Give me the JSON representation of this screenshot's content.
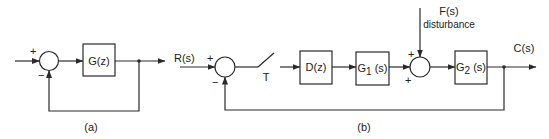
{
  "diagram_a": {
    "block": "G(z)",
    "sum_plus": "+",
    "sum_minus": "−",
    "caption": "(a)"
  },
  "diagram_b": {
    "input_label": "R(s)",
    "sum1_plus": "+",
    "sum1_minus": "−",
    "sampler_label": "T",
    "blocks": [
      "D(z)",
      "G1(s)",
      "G2(s)"
    ],
    "block_g1_main": "G",
    "block_g1_sub": "1",
    "block_g1_tail": " (s)",
    "block_g2_main": "G",
    "block_g2_sub": "2",
    "block_g2_tail": " (s)",
    "disturbance_signal": "F(s)",
    "disturbance_text": "disturbance",
    "sum2_plus_top": "+",
    "sum2_plus_left": "+",
    "output_label": "C(s)",
    "caption": "(b)"
  }
}
